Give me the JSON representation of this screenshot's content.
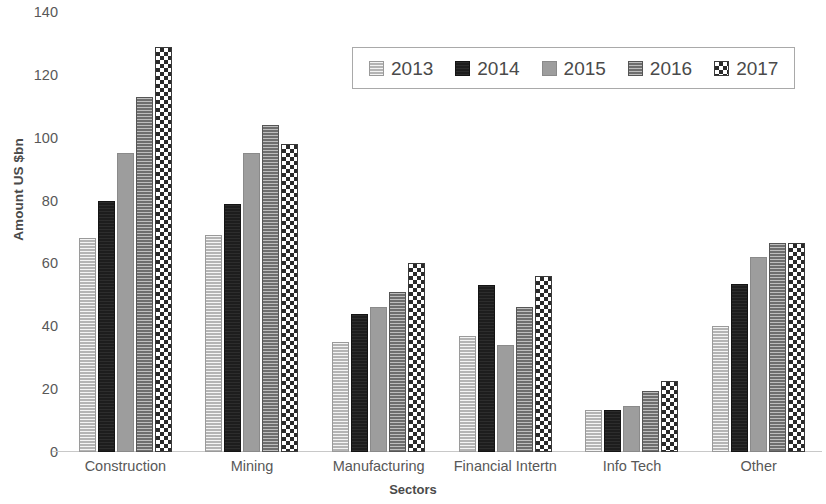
{
  "chart_data": {
    "type": "bar",
    "title": "",
    "xlabel": "Sectors",
    "ylabel": "Amount US $bn",
    "ylim": [
      0,
      140
    ],
    "yticks": [
      0,
      20,
      40,
      60,
      80,
      100,
      120,
      140
    ],
    "grid": false,
    "legend_position": "top-center",
    "categories": [
      "Construction",
      "Mining",
      "Manufacturing",
      "Financial Intertn",
      "Info Tech",
      "Other"
    ],
    "series": [
      {
        "name": "2013",
        "pattern": "light-gray-horizontal-hatch",
        "color": "#b4b4b4",
        "values": [
          68,
          69,
          35,
          37,
          13.5,
          40
        ]
      },
      {
        "name": "2014",
        "pattern": "solid-black",
        "color": "#1d1d1d",
        "values": [
          80,
          79,
          44,
          53,
          13.5,
          53.5
        ]
      },
      {
        "name": "2015",
        "pattern": "solid-medium-gray",
        "color": "#9d9d9d",
        "values": [
          95,
          95,
          46,
          34,
          14.5,
          62
        ]
      },
      {
        "name": "2016",
        "pattern": "dark-gray-horizontal-hatch",
        "color": "#6e6e6e",
        "values": [
          113,
          104,
          51,
          46,
          19.5,
          66.5
        ]
      },
      {
        "name": "2017",
        "pattern": "checkerboard",
        "color": "#2a2a2a",
        "values": [
          129,
          98,
          60,
          56,
          22.5,
          66.5
        ]
      }
    ]
  }
}
